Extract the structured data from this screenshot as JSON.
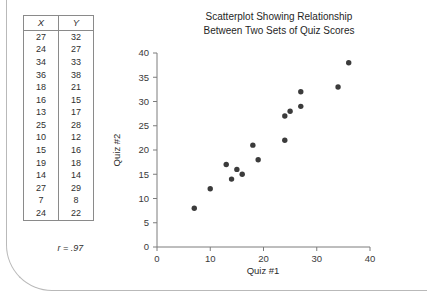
{
  "table": {
    "headers": [
      "X",
      "Y"
    ],
    "rows": [
      [
        27,
        32
      ],
      [
        24,
        27
      ],
      [
        34,
        33
      ],
      [
        36,
        38
      ],
      [
        18,
        21
      ],
      [
        16,
        15
      ],
      [
        13,
        17
      ],
      [
        25,
        28
      ],
      [
        10,
        12
      ],
      [
        15,
        16
      ],
      [
        19,
        18
      ],
      [
        14,
        14
      ],
      [
        27,
        29
      ],
      [
        7,
        8
      ],
      [
        24,
        22
      ]
    ],
    "correlation_label": "r = .97"
  },
  "chart_data": {
    "type": "scatter",
    "title": "Scatterplot Showing Relationship Between Two Sets of Quiz Scores",
    "title_line1": "Scatterplot Showing Relationship",
    "title_line2": "Between Two Sets of Quiz Scores",
    "xlabel": "Quiz #1",
    "ylabel": "Quiz #2",
    "xlim": [
      0,
      40
    ],
    "ylim": [
      0,
      40
    ],
    "xticks": [
      0,
      10,
      20,
      30,
      40
    ],
    "yticks": [
      0,
      5,
      10,
      15,
      20,
      25,
      30,
      35,
      40
    ],
    "grid": false,
    "legend": null,
    "marker": "circle",
    "marker_color": "#3b3b3b",
    "annotations": [
      "r = .97"
    ],
    "x": [
      27,
      24,
      34,
      36,
      18,
      16,
      13,
      25,
      10,
      15,
      19,
      14,
      27,
      7,
      24
    ],
    "y": [
      32,
      27,
      33,
      38,
      21,
      15,
      17,
      28,
      12,
      16,
      18,
      14,
      29,
      8,
      22
    ],
    "points": [
      {
        "x": 27,
        "y": 32
      },
      {
        "x": 24,
        "y": 27
      },
      {
        "x": 34,
        "y": 33
      },
      {
        "x": 36,
        "y": 38
      },
      {
        "x": 18,
        "y": 21
      },
      {
        "x": 16,
        "y": 15
      },
      {
        "x": 13,
        "y": 17
      },
      {
        "x": 25,
        "y": 28
      },
      {
        "x": 10,
        "y": 12
      },
      {
        "x": 15,
        "y": 16
      },
      {
        "x": 19,
        "y": 18
      },
      {
        "x": 14,
        "y": 14
      },
      {
        "x": 27,
        "y": 29
      },
      {
        "x": 7,
        "y": 8
      },
      {
        "x": 24,
        "y": 22
      }
    ]
  }
}
